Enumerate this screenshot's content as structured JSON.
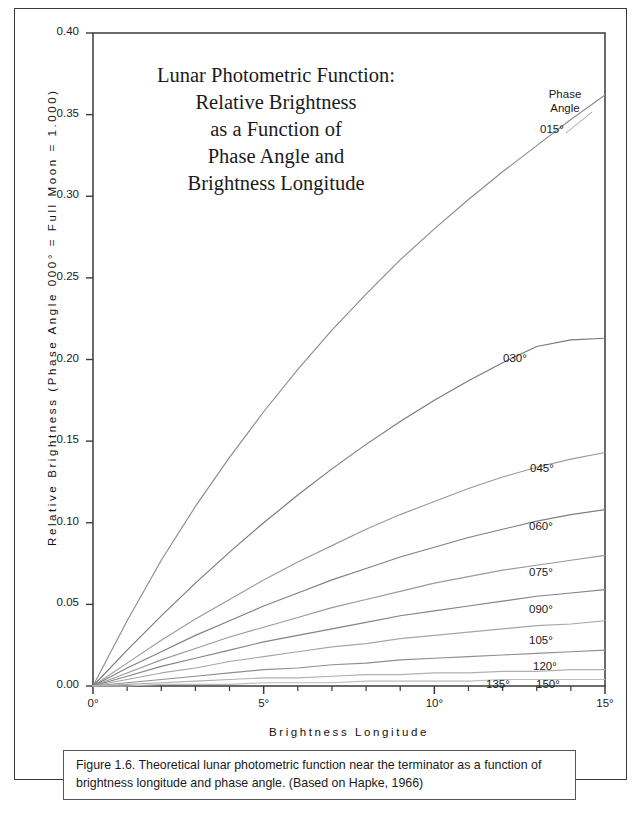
{
  "figure": {
    "caption": "Figure 1.6. Theoretical lunar photometric function near the terminator as a function of brightness longitude and phase angle. (Based on Hapke, 1966)"
  },
  "chart_data": {
    "type": "line",
    "title": "Lunar Photometric Function: Relative Brightness as a Function of Phase Angle and Brightness Longitude",
    "title_lines": [
      "Lunar Photometric Function:",
      "Relative Brightness",
      "as a Function of",
      "Phase Angle and",
      "Brightness Longitude"
    ],
    "xlabel": "Brightness Longitude",
    "ylabel": "Relative Brightness (Phase Angle 000° = Full Moon = 1.000)",
    "xlim": [
      0,
      15
    ],
    "ylim": [
      0,
      0.4
    ],
    "xticks": [
      0,
      5,
      10,
      15
    ],
    "xtick_labels": [
      "0°",
      "5°",
      "10°",
      "15°"
    ],
    "xtick_minor_step": 1,
    "yticks": [
      0.0,
      0.05,
      0.1,
      0.15,
      0.2,
      0.25,
      0.3,
      0.35,
      0.4
    ],
    "ytick_labels": [
      "0.00",
      "0.05",
      "0.10",
      "0.15",
      "0.20",
      "0.25",
      "0.30",
      "0.35",
      "0.40"
    ],
    "grid": false,
    "legend_position": "inline-right",
    "legend_title_lines": [
      "Phase",
      "Angle"
    ],
    "x": [
      0,
      1,
      2,
      3,
      4,
      5,
      6,
      7,
      8,
      9,
      10,
      11,
      12,
      13,
      14,
      15
    ],
    "series": [
      {
        "name": "015°",
        "color": "#8c8c8c",
        "values": [
          0.0,
          0.04,
          0.077,
          0.11,
          0.14,
          0.168,
          0.194,
          0.218,
          0.24,
          0.261,
          0.28,
          0.298,
          0.315,
          0.331,
          0.347,
          0.362
        ]
      },
      {
        "name": "030°",
        "color": "#7a7a7a",
        "values": [
          0.0,
          0.022,
          0.043,
          0.063,
          0.082,
          0.1,
          0.117,
          0.133,
          0.148,
          0.162,
          0.175,
          0.187,
          0.198,
          0.208,
          0.212,
          0.213
        ]
      },
      {
        "name": "045°",
        "color": "#9a9a9a",
        "values": [
          0.0,
          0.014,
          0.028,
          0.041,
          0.053,
          0.065,
          0.076,
          0.086,
          0.096,
          0.105,
          0.113,
          0.121,
          0.128,
          0.134,
          0.139,
          0.143
        ]
      },
      {
        "name": "060°",
        "color": "#808080",
        "values": [
          0.0,
          0.011,
          0.021,
          0.031,
          0.04,
          0.049,
          0.057,
          0.065,
          0.072,
          0.079,
          0.085,
          0.091,
          0.096,
          0.101,
          0.105,
          0.108
        ]
      },
      {
        "name": "075°",
        "color": "#9a9a9a",
        "values": [
          0.0,
          0.008,
          0.016,
          0.023,
          0.03,
          0.036,
          0.042,
          0.048,
          0.053,
          0.058,
          0.063,
          0.067,
          0.071,
          0.074,
          0.077,
          0.08
        ]
      },
      {
        "name": "090°",
        "color": "#848484",
        "values": [
          0.0,
          0.006,
          0.012,
          0.017,
          0.022,
          0.027,
          0.031,
          0.035,
          0.039,
          0.043,
          0.046,
          0.049,
          0.052,
          0.055,
          0.057,
          0.059
        ]
      },
      {
        "name": "105°",
        "color": "#a6a6a6",
        "values": [
          0.0,
          0.004,
          0.008,
          0.011,
          0.015,
          0.018,
          0.021,
          0.024,
          0.026,
          0.029,
          0.031,
          0.033,
          0.035,
          0.037,
          0.038,
          0.04
        ]
      },
      {
        "name": "120°",
        "color": "#8f8f8f",
        "values": [
          0.0,
          0.002,
          0.004,
          0.006,
          0.008,
          0.01,
          0.011,
          0.013,
          0.014,
          0.016,
          0.017,
          0.018,
          0.019,
          0.02,
          0.021,
          0.022
        ]
      },
      {
        "name": "135°",
        "color": "#b0b0b0",
        "values": [
          0.0,
          0.001,
          0.002,
          0.003,
          0.004,
          0.005,
          0.005,
          0.006,
          0.007,
          0.007,
          0.008,
          0.008,
          0.009,
          0.009,
          0.01,
          0.01
        ]
      },
      {
        "name": "150°",
        "color": "#bcbcbc",
        "values": [
          0.0,
          0.0,
          0.001,
          0.001,
          0.001,
          0.002,
          0.002,
          0.002,
          0.003,
          0.003,
          0.003,
          0.003,
          0.004,
          0.004,
          0.004,
          0.004
        ]
      }
    ],
    "series_label_anchors": [
      {
        "name": "015°",
        "left": 540,
        "top": 123
      },
      {
        "name": "030°",
        "left": 503,
        "top": 352
      },
      {
        "name": "045°",
        "left": 530,
        "top": 462
      },
      {
        "name": "060°",
        "left": 529,
        "top": 520
      },
      {
        "name": "075°",
        "left": 529,
        "top": 566
      },
      {
        "name": "090°",
        "left": 529,
        "top": 603
      },
      {
        "name": "105°",
        "left": 529,
        "top": 634
      },
      {
        "name": "120°",
        "left": 533,
        "top": 660
      },
      {
        "name": "135°",
        "left": 486,
        "top": 678
      },
      {
        "name": "150°",
        "left": 536,
        "top": 678
      }
    ]
  }
}
